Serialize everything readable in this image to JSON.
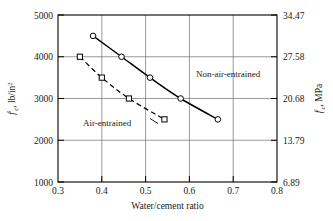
{
  "chart_data": {
    "type": "line",
    "title": "",
    "xlabel": "Water/cement ratio",
    "ylabel_left": "f'c, lb/in2",
    "ylabel_right": "f'c, MPa",
    "xlim": [
      0.3,
      0.8
    ],
    "ylim_left": [
      1000,
      5000
    ],
    "ylim_right": [
      6.89,
      34.47
    ],
    "grid": true,
    "legend_position": "inline-annotations",
    "xticks": [
      "0.3",
      "0.4",
      "0.5",
      "0.6",
      "0.7",
      "0.8"
    ],
    "xtick_values": [
      0.3,
      0.4,
      0.5,
      0.6,
      0.7,
      0.8
    ],
    "yticks_left": [
      "5000",
      "4000",
      "3000",
      "2000",
      "1000"
    ],
    "ytick_values_left": [
      5000,
      4000,
      3000,
      2000,
      1000
    ],
    "yticks_right": [
      "34.47",
      "27.58",
      "20.68",
      "13.79",
      "6.89"
    ],
    "ytick_values_right": [
      34.47,
      27.58,
      20.68,
      13.79,
      6.89
    ],
    "series": [
      {
        "name": "Non-air-entrained",
        "style": "solid",
        "marker": "circle",
        "x": [
          0.38,
          0.445,
          0.51,
          0.58,
          0.665
        ],
        "values": [
          4500,
          4000,
          3500,
          3000,
          2500
        ]
      },
      {
        "name": "Air-entrained",
        "style": "dashed",
        "marker": "square",
        "x": [
          0.35,
          0.4,
          0.462,
          0.543
        ],
        "values": [
          4000,
          3500,
          3000,
          2500
        ]
      }
    ],
    "annotations": [
      {
        "text": "Non-air-entrained",
        "x": 0.565,
        "y": 3560
      },
      {
        "text": "Air-entrained",
        "x": 0.425,
        "y": 2430
      }
    ]
  },
  "axis_labels": {
    "x_title": "Water/cement ratio",
    "y_left_prefix": "f",
    "y_left_prime": "'",
    "y_left_sub": "c",
    "y_left_unit": ", lb/in",
    "y_left_sup": "2",
    "y_right_prefix": "f",
    "y_right_prime": "'",
    "y_right_sub": "c",
    "y_right_unit": ", MPa"
  },
  "colors": {
    "ink": "#000000",
    "grid": "#6e6e6e",
    "background": "#ffffff",
    "marker_fill": "#ffffff"
  }
}
